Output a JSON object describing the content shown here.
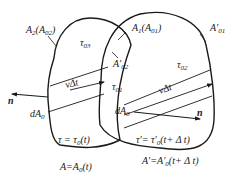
{
  "diagram": {
    "type": "control-volume-overlap",
    "regions": [
      {
        "id": "region-A2",
        "label_main": "A",
        "label_sub": "2",
        "label_paren_main": "A",
        "label_paren_sub": "02",
        "interior_label_main": "τ",
        "interior_label_sub": "03"
      },
      {
        "id": "region-A1",
        "label_main": "A",
        "label_sub": "1",
        "label_paren_main": "A",
        "label_paren_sub": "01",
        "interior_label_main": "τ",
        "interior_label_sub": "02"
      }
    ],
    "labels": {
      "a_prime_02_main": "A′",
      "a_prime_02_sub": "02",
      "a_prime_01_main": "A′",
      "a_prime_01_sub": "01",
      "tau_01_main": "τ",
      "tau_01_sub": "01",
      "v_delta_t": "νΔt",
      "dA0_left_main": "dA",
      "dA0_left_sub": "0",
      "dA0_right_main": "dA",
      "dA0_right_sub": "0",
      "normal_left": "n",
      "normal_right": "n",
      "left_tau_eq": "τ = τ",
      "left_tau_sub": "0",
      "left_tau_arg": "(t)",
      "left_area_eq": "A=A",
      "left_area_sub": "0",
      "left_area_arg": "(t)",
      "right_tau_eq": "τ′= τ′",
      "right_tau_sub": "0",
      "right_tau_arg": "(t+ Δ t)",
      "right_area_eq": "A′=A′",
      "right_area_sub": "0",
      "right_area_arg": "(t+ Δ t)"
    },
    "colors": {
      "stroke": "#1a1a1a",
      "background": "#ffffff"
    }
  }
}
